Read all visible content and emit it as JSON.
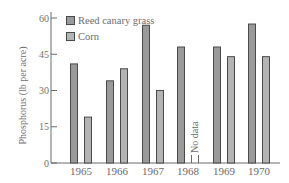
{
  "chart_data": {
    "type": "bar",
    "title": "",
    "xlabel": "",
    "ylabel": "Phosphorus (lb per acre)",
    "ylim": [
      0,
      60
    ],
    "yticks": [
      0,
      15,
      30,
      45,
      60
    ],
    "grid": false,
    "legend_position": "top-left (inside)",
    "categories": [
      "1965",
      "1966",
      "1967",
      "1968",
      "1969",
      "1970"
    ],
    "series": [
      {
        "name": "Reed canary grass",
        "color": "#9a9a9a",
        "values": [
          41,
          34,
          57,
          48,
          48,
          57.5
        ]
      },
      {
        "name": "Corn",
        "color": "#b4b4b4",
        "values": [
          19,
          39,
          30,
          null,
          44,
          44
        ]
      }
    ],
    "annotations": [
      {
        "category": "1968",
        "series": "Corn",
        "text": "No data"
      }
    ]
  },
  "legend": {
    "items": [
      {
        "label": "Reed canary grass"
      },
      {
        "label": "Corn"
      }
    ]
  },
  "axis": {
    "ylabel": "Phosphorus (lb per acre)",
    "no_data_label": "No data"
  }
}
